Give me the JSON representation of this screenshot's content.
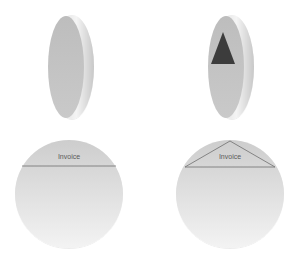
{
  "figure": {
    "panels": [
      {
        "id": "left",
        "pill": {
          "icon": "none"
        },
        "circle": {
          "label": "Invoice",
          "divider": "horizontal-line"
        }
      },
      {
        "id": "right",
        "pill": {
          "icon": "triangle-up"
        },
        "circle": {
          "label": "Invoice",
          "divider": "triangle-roof"
        }
      }
    ],
    "colors": {
      "pill_face": "#b9b9b9",
      "pill_rim": "#ececec",
      "circle_top": "#cfcfcf",
      "circle_bottom": "#f1f1f1",
      "line": "#6e6e6e",
      "triangle": "#3c3c3c"
    }
  }
}
